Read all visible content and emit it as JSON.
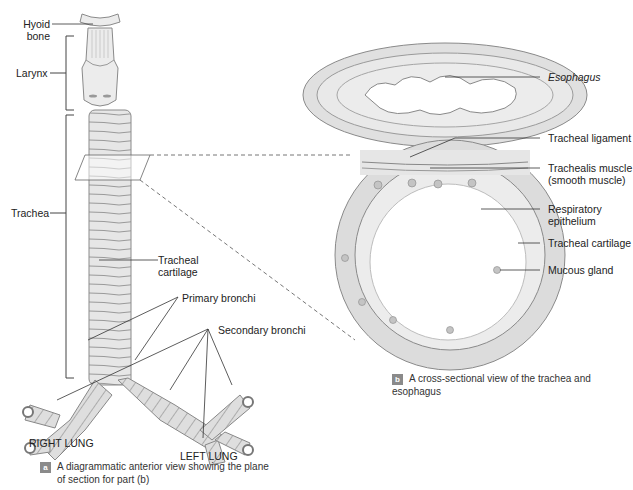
{
  "figure_a": {
    "labels": {
      "hyoid_bone": "Hyoid\nbone",
      "hyoid_line1": "Hyoid",
      "hyoid_line2": "bone",
      "larynx": "Larynx",
      "trachea": "Trachea",
      "tracheal_cartilage_line1": "Tracheal",
      "tracheal_cartilage_line2": "cartilage",
      "primary_bronchi": "Primary bronchi",
      "secondary_bronchi": "Secondary bronchi",
      "right_lung": "RIGHT LUNG",
      "left_lung": "LEFT LUNG"
    },
    "caption": {
      "badge": "a",
      "line1": "A diagrammatic anterior view showing the plane",
      "line2": "of section for part (b)"
    }
  },
  "figure_b": {
    "labels": {
      "esophagus": "Esophagus",
      "tracheal_ligament": "Tracheal ligament",
      "trachealis_line1": "Trachealis muscle",
      "trachealis_line2": "(smooth muscle)",
      "respiratory_line1": "Respiratory",
      "respiratory_line2": "epithelium",
      "tracheal_cartilage": "Tracheal cartilage",
      "mucous_gland": "Mucous gland"
    },
    "caption": {
      "badge": "b",
      "text": "A cross-sectional view of the trachea and esophagus"
    }
  },
  "colors": {
    "tissue_fill": "#e4e4e4",
    "tissue_stroke": "#8c8c8c",
    "cartilage_fill": "#d8d8d8",
    "badge": "#8a8a8a",
    "line": "#333333"
  }
}
